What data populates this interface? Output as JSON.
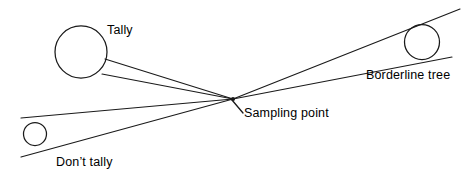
{
  "figure": {
    "background_color": "#ffffff",
    "line_color": "#1a1a1a",
    "text_color": "#000000",
    "width": 462,
    "height": 173
  },
  "labels": {
    "tally": "Tally",
    "borderline_tree": "Borderline tree",
    "sampling_point": "Sampling point",
    "dont_tally": "Don’t tally"
  },
  "geometry": {
    "sampling_point": {
      "x": 233,
      "y": 99
    },
    "circles": [
      {
        "name": "tally-tree",
        "cx": 81,
        "cy": 52,
        "r": 26
      },
      {
        "name": "borderline-tree",
        "cx": 422,
        "cy": 42,
        "r": 17.5
      },
      {
        "name": "dont-tally-tree",
        "cx": 35,
        "cy": 134,
        "r": 11.5
      }
    ],
    "sight_lines": [
      {
        "name": "tally-upper-sight",
        "x1": 233,
        "y1": 99,
        "x2": 105,
        "y2": 59
      },
      {
        "name": "tally-lower-sight",
        "x1": 233,
        "y1": 99,
        "x2": 102,
        "y2": 74
      },
      {
        "name": "borderline-upper-sight",
        "x1": 233,
        "y1": 99,
        "x2": 460,
        "y2": 9
      },
      {
        "name": "borderline-lower-sight",
        "x1": 233,
        "y1": 99,
        "x2": 452,
        "y2": 57
      },
      {
        "name": "dont-tally-upper-sight",
        "x1": 233,
        "y1": 99,
        "x2": 21,
        "y2": 118
      },
      {
        "name": "dont-tally-lower-sight",
        "x1": 233,
        "y1": 99,
        "x2": 21,
        "y2": 157
      }
    ],
    "leader_line": {
      "name": "sampling-point-leader",
      "x1": 243,
      "y1": 113,
      "x2": 232,
      "y2": 100
    }
  }
}
